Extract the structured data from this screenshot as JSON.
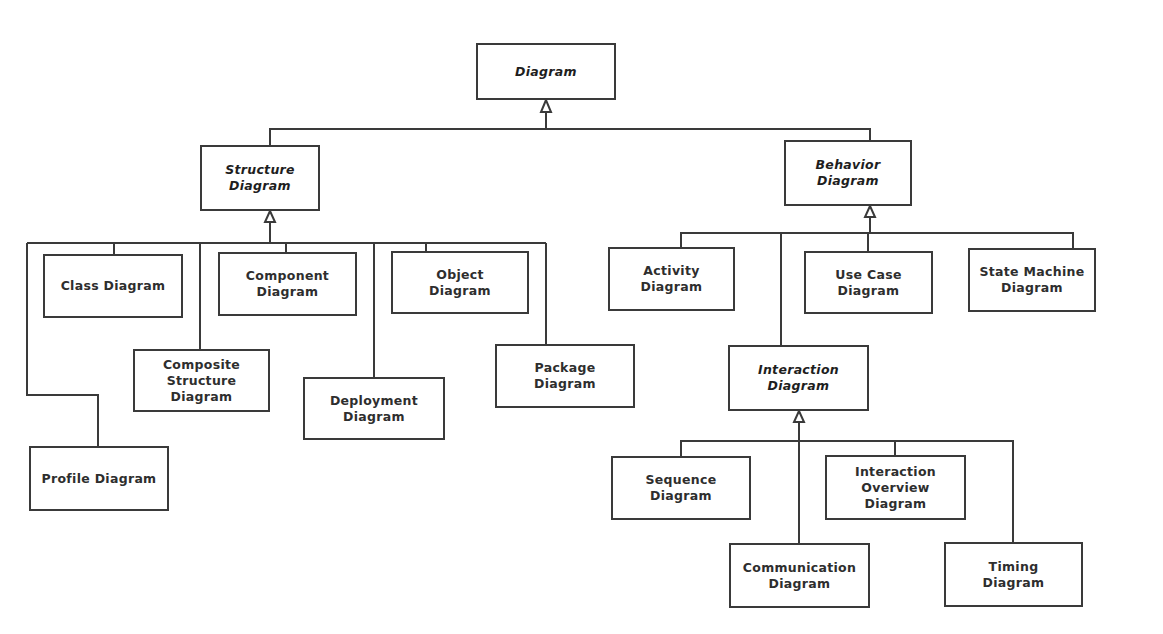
{
  "diagram": {
    "colors": {
      "line": "#3a3a3a",
      "border": "#3a3a3a",
      "text": "#2e2e2e",
      "background": "#ffffff"
    },
    "nodes": {
      "diagram": {
        "label": "Diagram",
        "abstract": true
      },
      "structure": {
        "label": "Structure\nDiagram",
        "abstract": true
      },
      "behavior": {
        "label": "Behavior\nDiagram",
        "abstract": true
      },
      "class": {
        "label": "Class Diagram",
        "abstract": false
      },
      "component": {
        "label": "Component\nDiagram",
        "abstract": false
      },
      "object": {
        "label": "Object\nDiagram",
        "abstract": false
      },
      "composite": {
        "label": "Composite\nStructure\nDiagram",
        "abstract": false
      },
      "deployment": {
        "label": "Deployment\nDiagram",
        "abstract": false
      },
      "package": {
        "label": "Package\nDiagram",
        "abstract": false
      },
      "profile": {
        "label": "Profile Diagram",
        "abstract": false
      },
      "activity": {
        "label": "Activity\nDiagram",
        "abstract": false
      },
      "use_case": {
        "label": "Use Case\nDiagram",
        "abstract": false
      },
      "state_machine": {
        "label": "State Machine\nDiagram",
        "abstract": false
      },
      "interaction": {
        "label": "Interaction\nDiagram",
        "abstract": true
      },
      "sequence": {
        "label": "Sequence\nDiagram",
        "abstract": false
      },
      "interaction_overview": {
        "label": "Interaction\nOverview\nDiagram",
        "abstract": false
      },
      "communication": {
        "label": "Communication\nDiagram",
        "abstract": false
      },
      "timing": {
        "label": "Timing\nDiagram",
        "abstract": false
      }
    },
    "edges": [
      {
        "from": "structure",
        "to": "diagram",
        "type": "generalization"
      },
      {
        "from": "behavior",
        "to": "diagram",
        "type": "generalization"
      },
      {
        "from": "class",
        "to": "structure",
        "type": "generalization"
      },
      {
        "from": "component",
        "to": "structure",
        "type": "generalization"
      },
      {
        "from": "object",
        "to": "structure",
        "type": "generalization"
      },
      {
        "from": "composite",
        "to": "structure",
        "type": "generalization"
      },
      {
        "from": "deployment",
        "to": "structure",
        "type": "generalization"
      },
      {
        "from": "package",
        "to": "structure",
        "type": "generalization"
      },
      {
        "from": "profile",
        "to": "structure",
        "type": "generalization"
      },
      {
        "from": "activity",
        "to": "behavior",
        "type": "generalization"
      },
      {
        "from": "use_case",
        "to": "behavior",
        "type": "generalization"
      },
      {
        "from": "state_machine",
        "to": "behavior",
        "type": "generalization"
      },
      {
        "from": "interaction",
        "to": "behavior",
        "type": "generalization"
      },
      {
        "from": "sequence",
        "to": "interaction",
        "type": "generalization"
      },
      {
        "from": "interaction_overview",
        "to": "interaction",
        "type": "generalization"
      },
      {
        "from": "communication",
        "to": "interaction",
        "type": "generalization"
      },
      {
        "from": "timing",
        "to": "interaction",
        "type": "generalization"
      }
    ]
  }
}
